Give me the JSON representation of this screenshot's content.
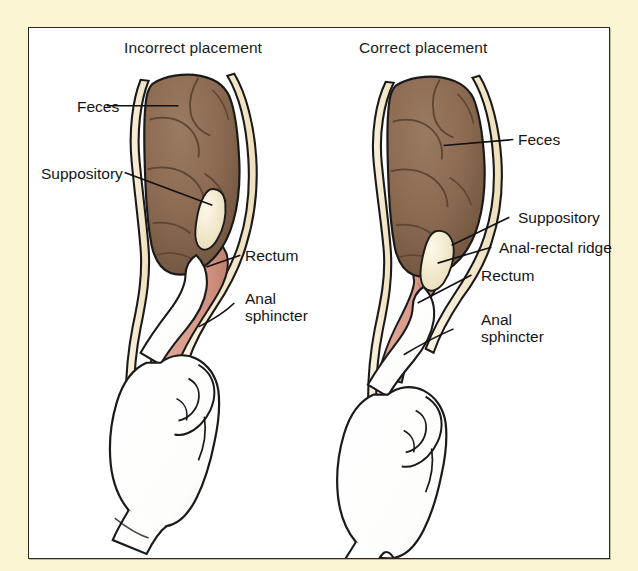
{
  "figure": {
    "type": "medical-illustration",
    "background_color": "#faf6d3",
    "panel_background": "#ffffff",
    "border_color": "#2a2a22",
    "panels": [
      {
        "id": "incorrect",
        "heading": "Incorrect placement",
        "labels": [
          {
            "name": "feces",
            "text": "Feces"
          },
          {
            "name": "suppository",
            "text": "Suppository"
          },
          {
            "name": "rectum",
            "text": "Rectum"
          },
          {
            "name": "anal-sphincter-line1",
            "text": "Anal"
          },
          {
            "name": "anal-sphincter-line2",
            "text": "sphincter"
          }
        ]
      },
      {
        "id": "correct",
        "heading": "Correct placement",
        "labels": [
          {
            "name": "feces",
            "text": "Feces"
          },
          {
            "name": "suppository",
            "text": "Suppository"
          },
          {
            "name": "anal-rectal-ridge",
            "text": "Anal-rectal ridge"
          },
          {
            "name": "rectum",
            "text": "Rectum"
          },
          {
            "name": "anal-sphincter-line1",
            "text": "Anal"
          },
          {
            "name": "anal-sphincter-line2",
            "text": "sphincter"
          }
        ]
      }
    ],
    "colors": {
      "feces": "#8b6a51",
      "feces_shadow": "#6d5340",
      "suppository": "#f3eacd",
      "rectum": "#d99b8c",
      "rectum_shadow": "#c48475",
      "bowel_wall": "#f6ecd2",
      "glove": "#ffffff",
      "outline": "#1a1a1a",
      "leader_line": "#111111",
      "text": "#151515"
    }
  }
}
